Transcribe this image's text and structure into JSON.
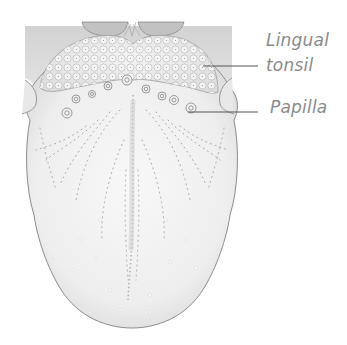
{
  "figure": {
    "labels": [
      {
        "id": "lingual-tonsil",
        "lines": [
          "Lingual",
          "tonsil"
        ]
      },
      {
        "id": "papilla",
        "lines": [
          "Papilla"
        ]
      }
    ]
  },
  "colors": {
    "background": "#ffffff",
    "tongue_fill": "#eeeeee",
    "tongue_outline": "#8c8c8c",
    "shading": "#bdbdbd",
    "label_text": "#8a8a8a",
    "leader_line": "#555555"
  }
}
